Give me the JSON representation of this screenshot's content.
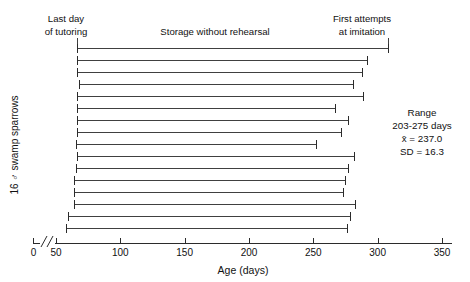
{
  "figure": {
    "y_axis_label": "16 ♂ swamp sparrows",
    "x_axis_label": "Age (days)"
  },
  "annotations": {
    "left_line1": "Last day",
    "left_line2": "of tutoring",
    "center": "Storage without rehearsal",
    "right_line1": "First attempts",
    "right_line2": "at imitation"
  },
  "stats": {
    "title": "Range",
    "range": "203-275 days",
    "mean": "x̄ = 237.0",
    "sd": "SD = 16.3"
  },
  "chart_data": {
    "type": "bar",
    "orientation": "horizontal",
    "title": "",
    "subtitle": "",
    "xlabel": "Age (days)",
    "ylabel": "16 ♂ swamp sparrows",
    "xlim": [
      50,
      360
    ],
    "axis_break_at": 0,
    "xticks": [
      0,
      50,
      100,
      150,
      200,
      250,
      300,
      350
    ],
    "xticklabels": [
      "0",
      "50",
      "100",
      "150",
      "200",
      "250",
      "300",
      "350"
    ],
    "grid": false,
    "legend": false,
    "categories": [
      "bird-1",
      "bird-2",
      "bird-3",
      "bird-4",
      "bird-5",
      "bird-6",
      "bird-7",
      "bird-8",
      "bird-9",
      "bird-10",
      "bird-11",
      "bird-12",
      "bird-13",
      "bird-14",
      "bird-15",
      "bird-16"
    ],
    "series": [
      {
        "name": "Last day of tutoring (interval start)",
        "values": [
          63,
          63,
          63,
          65,
          63,
          63,
          63,
          63,
          62,
          63,
          62,
          62,
          62,
          62,
          55,
          52
        ]
      },
      {
        "name": "First attempts at imitation (interval end)",
        "values": [
          348,
          318,
          311,
          298,
          313,
          273,
          291,
          281,
          245,
          299,
          290,
          286,
          282,
          299,
          292,
          287
        ]
      }
    ],
    "interval_lengths_days": [
      285,
      255,
      248,
      233,
      250,
      210,
      228,
      218,
      183,
      236,
      228,
      224,
      220,
      237,
      237,
      235
    ],
    "summary_range_start": 203,
    "summary_range_end": 275,
    "summary_mean": 237.0,
    "summary_sd": 16.3,
    "reference_bracket": {
      "label": "",
      "start": 55,
      "end": 293
    },
    "colors": {
      "line": "#2b2b2b",
      "text": "#111111",
      "background": "#ffffff"
    }
  }
}
